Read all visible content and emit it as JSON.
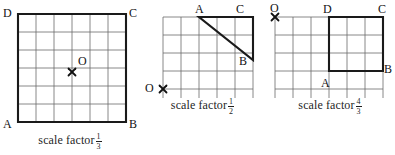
{
  "figures": [
    {
      "id": "figure-square-scale-one-third",
      "caption_prefix": "scale factor",
      "scale_factor": {
        "numerator": "1",
        "denominator": "3"
      },
      "grid": {
        "cols": 6,
        "rows": 6,
        "x0": 18,
        "y0": 14,
        "cell": 18
      },
      "shape": {
        "type": "square",
        "vertices": [
          {
            "label": "D",
            "gx": 0,
            "gy": 0
          },
          {
            "label": "C",
            "gx": 6,
            "gy": 0
          },
          {
            "label": "B",
            "gx": 6,
            "gy": 6
          },
          {
            "label": "A",
            "gx": 0,
            "gy": 6
          }
        ]
      },
      "center_of_enlargement": {
        "label": "O",
        "marker": "x-marker",
        "gx": 3,
        "gy": 3.2,
        "label_dx": 8,
        "label_dy": -16
      },
      "labels": [
        {
          "name": "vertex-label-D",
          "text": "D",
          "x": 3,
          "y": 7
        },
        {
          "name": "vertex-label-C",
          "text": "C",
          "x": 129,
          "y": 7
        },
        {
          "name": "vertex-label-A",
          "text": "A",
          "x": 3,
          "y": 118
        },
        {
          "name": "vertex-label-B",
          "text": "B",
          "x": 129,
          "y": 118
        }
      ]
    },
    {
      "id": "figure-triangle-scale-one-half",
      "caption_prefix": "scale factor",
      "scale_factor": {
        "numerator": "1",
        "denominator": "2"
      },
      "grid": {
        "cols": 5,
        "rows": 5,
        "x0": 23,
        "y0": 17,
        "cell": 18
      },
      "shape": {
        "type": "triangle",
        "vertices": [
          {
            "label": "A",
            "gx": 2,
            "gy": 0
          },
          {
            "label": "C",
            "gx": 4,
            "gy": 0
          },
          {
            "label": "B",
            "gx": 4,
            "gy": 2.4
          }
        ]
      },
      "center_of_enlargement": {
        "label": "O",
        "marker": "x-marker",
        "gx": 0,
        "gy": 4,
        "label_dx": -17,
        "label_dy": -6
      },
      "labels": [
        {
          "name": "vertex-label-A",
          "text": "A",
          "x": 55,
          "y": 3
        },
        {
          "name": "vertex-label-C",
          "text": "C",
          "x": 96,
          "y": 3
        },
        {
          "name": "vertex-label-B",
          "text": "B",
          "x": 99,
          "y": 55
        },
        {
          "name": "origin-label-O",
          "text": "O",
          "x": 5,
          "y": 82
        }
      ]
    },
    {
      "id": "figure-square-scale-four-thirds",
      "caption_prefix": "scale factor",
      "scale_factor": {
        "numerator": "4",
        "denominator": "3"
      },
      "grid": {
        "cols": 6,
        "rows": 5,
        "x0": 10,
        "y0": 17,
        "cell": 18
      },
      "shape": {
        "type": "square",
        "vertices": [
          {
            "label": "D",
            "gx": 3,
            "gy": 0
          },
          {
            "label": "C",
            "gx": 6,
            "gy": 0
          },
          {
            "label": "B",
            "gx": 6,
            "gy": 3
          },
          {
            "label": "A",
            "gx": 3,
            "gy": 3
          }
        ]
      },
      "center_of_enlargement": {
        "label": "O",
        "marker": "x-marker",
        "gx": 0,
        "gy": 0,
        "label_dx": -2,
        "label_dy": -16
      },
      "labels": [
        {
          "name": "origin-label-O",
          "text": "O",
          "x": 5,
          "y": 2
        },
        {
          "name": "vertex-label-D",
          "text": "D",
          "x": 58,
          "y": 3
        },
        {
          "name": "vertex-label-C",
          "text": "C",
          "x": 113,
          "y": 3
        },
        {
          "name": "vertex-label-B",
          "text": "B",
          "x": 119,
          "y": 63
        },
        {
          "name": "vertex-label-A",
          "text": "A",
          "x": 56,
          "y": 77
        }
      ]
    }
  ],
  "colors": {
    "grid_line": "#6b6b6b",
    "shape_stroke": "#1a1a1a",
    "text": "#111111",
    "background": "#ffffff"
  }
}
